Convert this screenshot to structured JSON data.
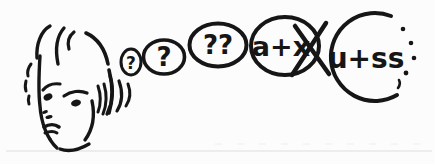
{
  "meta": {
    "background": "#fcfcfc",
    "ink_color": "#161616",
    "faint_line_color": "#d9d9d9"
  },
  "bubbles": [
    {
      "id": "tiny",
      "text": "?"
    },
    {
      "id": "small",
      "text": "?"
    },
    {
      "id": "medium",
      "text": "??"
    },
    {
      "id": "crossed",
      "text": "a+x",
      "prefix": "a+",
      "crossed_letter": "x",
      "crossed_out": true
    },
    {
      "id": "final",
      "text": "u+ss",
      "edge": "dotted-right"
    }
  ]
}
